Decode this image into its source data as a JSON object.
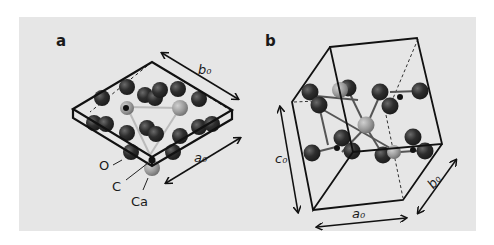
{
  "figure": {
    "background_color": "#e6e6e6",
    "panels": [
      {
        "id": "a",
        "label": "a",
        "axis_labels": {
          "b": "b₀",
          "a": "a₀"
        },
        "atom_labels": {
          "O": "O",
          "C": "C",
          "Ca": "Ca"
        }
      },
      {
        "id": "b",
        "label": "b",
        "axis_labels": {
          "c": "c₀",
          "a": "a₀",
          "b": "b₀"
        }
      }
    ],
    "colors": {
      "oxygen": "#2b2b2b",
      "calcium": "#9a9a9a",
      "carbon": "#111111",
      "lines": "#111111"
    }
  }
}
